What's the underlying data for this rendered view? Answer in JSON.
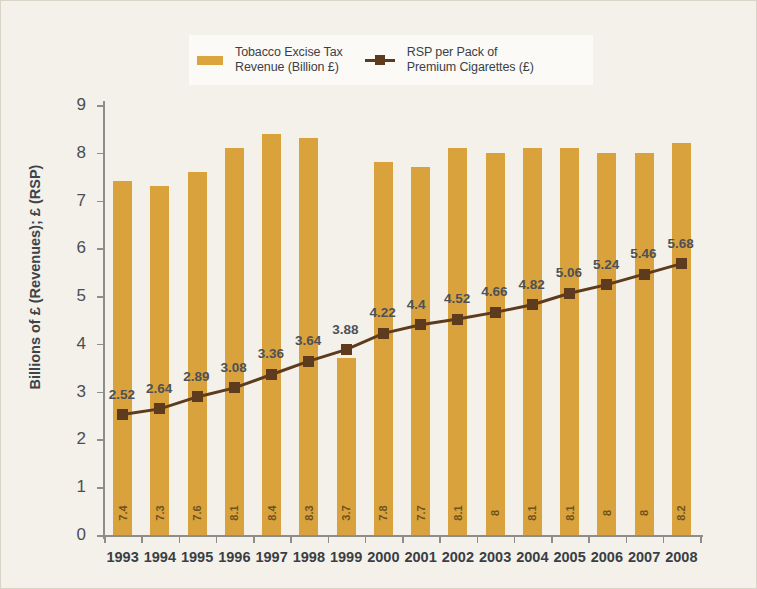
{
  "chart_data": {
    "type": "bar",
    "title": "",
    "subtitle": "",
    "xlabel": "",
    "ylabel": "Billions of £ (Revenues); £ (RSP)",
    "ylim": [
      0,
      9
    ],
    "yticks": [
      0,
      1,
      2,
      3,
      4,
      5,
      6,
      7,
      8,
      9
    ],
    "grid": false,
    "legend_position": "top-center",
    "categories": [
      "1993",
      "1994",
      "1995",
      "1996",
      "1997",
      "1998",
      "1999",
      "2000",
      "2001",
      "2002",
      "2003",
      "2004",
      "2005",
      "2006",
      "2007",
      "2008"
    ],
    "series": [
      {
        "name": "Tobacco Excise Tax Revenue (Billion £)",
        "type": "bar",
        "color": "#d9a23c",
        "values": [
          7.4,
          7.3,
          7.6,
          8.1,
          8.4,
          8.3,
          3.7,
          7.8,
          7.7,
          8.1,
          8.0,
          8.1,
          8.1,
          8.0,
          8.0,
          8.2
        ],
        "labels": [
          "7.4",
          "7.3",
          "7.6",
          "8.1",
          "8.4",
          "8.3",
          "3.7",
          "7.8",
          "7.7",
          "8.1",
          "8",
          "8.1",
          "8.1",
          "8",
          "8",
          "8.2"
        ]
      },
      {
        "name": "RSP per Pack of Premium Cigarettes (£)",
        "type": "line",
        "color": "#5d3b1c",
        "values": [
          2.52,
          2.64,
          2.89,
          3.08,
          3.36,
          3.64,
          3.88,
          4.22,
          4.4,
          4.52,
          4.66,
          4.82,
          5.06,
          5.24,
          5.46,
          5.68
        ],
        "labels": [
          "2.52",
          "2.64",
          "2.89",
          "3.08",
          "3.36",
          "3.64",
          "3.88",
          "4.22",
          "4.4",
          "4.52",
          "4.66",
          "4.82",
          "5.06",
          "5.24",
          "5.46",
          "5.68"
        ]
      }
    ]
  },
  "legend": {
    "entries": [
      {
        "label": "Tobacco Excise Tax\nRevenue (Billion £)",
        "marker": "bar-swatch",
        "color": "#d9a23c"
      },
      {
        "label": "RSP per Pack of\nPremium Cigarettes (£)",
        "marker": "line-square-swatch",
        "color": "#5d3b1c"
      }
    ]
  },
  "axes": {
    "y_title": "Billions of £ (Revenues); £ (RSP)"
  },
  "colors": {
    "background": "#f3f1e9",
    "bar": "#d9a23c",
    "line": "#5d3b1c",
    "axis": "#8d8e8c",
    "tick_text": "#4a4e55"
  }
}
